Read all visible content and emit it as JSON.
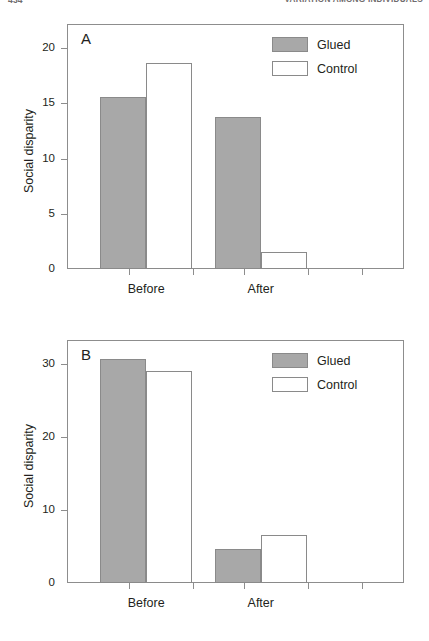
{
  "header": {
    "folio": "434",
    "running_title": "VARIATION AMONG INDIVIDUALS"
  },
  "legend": {
    "glued_label": "Glued",
    "control_label": "Control"
  },
  "axis": {
    "ylabel": "Social disparity",
    "x_before": "Before",
    "x_after": "After"
  },
  "panelA": {
    "letter": "A",
    "yticks": [
      "0",
      "5",
      "10",
      "15",
      "20"
    ]
  },
  "panelB": {
    "letter": "B",
    "yticks": [
      "0",
      "10",
      "20",
      "30"
    ]
  },
  "chart_data": [
    {
      "type": "bar",
      "title": "A",
      "xlabel": "",
      "ylabel": "Social disparity",
      "categories": [
        "Before",
        "After"
      ],
      "series": [
        {
          "name": "Glued",
          "values": [
            15.6,
            13.8
          ],
          "color": "#a8a8a8"
        },
        {
          "name": "Control",
          "values": [
            18.7,
            1.5
          ],
          "color": "#ffffff"
        }
      ],
      "ylim": [
        0,
        22.2
      ],
      "yticks": [
        0,
        5,
        10,
        15,
        20
      ],
      "grid": false,
      "legend_position": "top-right"
    },
    {
      "type": "bar",
      "title": "B",
      "xlabel": "",
      "ylabel": "Social disparity",
      "categories": [
        "Before",
        "After"
      ],
      "series": [
        {
          "name": "Glued",
          "values": [
            30.7,
            4.6
          ],
          "color": "#a8a8a8"
        },
        {
          "name": "Control",
          "values": [
            29.0,
            6.6
          ],
          "color": "#ffffff"
        }
      ],
      "ylim": [
        0,
        33.3
      ],
      "yticks": [
        0,
        10,
        20,
        30
      ],
      "grid": false,
      "legend_position": "top-right"
    }
  ]
}
